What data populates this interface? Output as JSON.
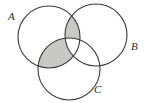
{
  "figure": {
    "kind": "venn-diagram",
    "set_count": 3,
    "background_color": "#ffffff",
    "stroke_color": "#3a3a3a",
    "stroke_width": 1.1,
    "shade_color": "#c9c9c4",
    "shade_opacity": 1
  },
  "sets": [
    {
      "id": "A",
      "label": "A",
      "label_position": "upper-left",
      "cx": 49,
      "cy": 37,
      "r": 31
    },
    {
      "id": "B",
      "label": "B",
      "label_position": "right",
      "cx": 96,
      "cy": 35,
      "r": 31
    },
    {
      "id": "C",
      "label": "C",
      "label_position": "bottom-right",
      "cx": 69,
      "cy": 69,
      "r": 31
    }
  ],
  "shaded_regions": [
    {
      "id": "A-and-B-only",
      "description": "A intersect B, excluding C",
      "expression": "(A ∩ B) \\ C",
      "color": "#c9c9c4"
    },
    {
      "id": "A-and-C-only",
      "description": "A intersect C, excluding B",
      "expression": "(A ∩ C) \\ B",
      "color": "#c9c9c4"
    }
  ],
  "unshaded_regions": [
    "A only",
    "B only",
    "C only",
    "(B ∩ C) \\ A",
    "A ∩ B ∩ C"
  ]
}
